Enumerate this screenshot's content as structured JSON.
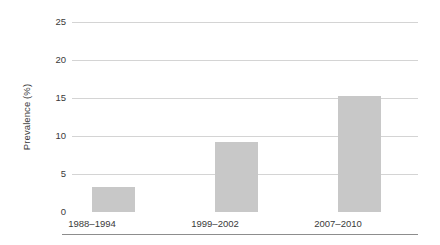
{
  "chart_data": {
    "type": "bar",
    "title": "",
    "subtitle": "",
    "xlabel": "",
    "ylabel": "Prevalence (%)",
    "categories": [
      "1988–1994",
      "1999–2002",
      "2007–2010"
    ],
    "values": [
      3.3,
      9.2,
      15.3
    ],
    "ylim": [
      0,
      25
    ],
    "yticks": [
      0,
      5,
      10,
      15,
      20,
      25
    ],
    "ytick_labels": [
      "0",
      "5",
      "10",
      "15",
      "20",
      "25"
    ],
    "grid": "horizontal",
    "legend": "none",
    "annotations": [],
    "colors": {
      "bar_fill": "#c8c8c8",
      "gridline": "#d4d4d4",
      "axis_line": "#8d8d8d",
      "text": "#3a3a3a",
      "background": "#ffffff"
    }
  }
}
